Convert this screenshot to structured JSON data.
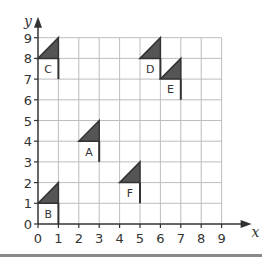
{
  "chart_data": {
    "type": "diagram",
    "title": "",
    "xlabel": "x",
    "ylabel": "y",
    "xlim": [
      0,
      9
    ],
    "ylim": [
      0,
      9
    ],
    "x_ticks": [
      "0",
      "1",
      "2",
      "3",
      "4",
      "5",
      "6",
      "7",
      "8",
      "9"
    ],
    "y_ticks": [
      "0",
      "1",
      "2",
      "3",
      "4",
      "5",
      "6",
      "7",
      "8",
      "9"
    ],
    "grid": true,
    "flags": [
      {
        "label": "A",
        "triangle": [
          [
            2,
            4
          ],
          [
            3,
            5
          ],
          [
            3,
            4
          ]
        ],
        "pole": [
          [
            3,
            4
          ],
          [
            3,
            3
          ]
        ]
      },
      {
        "label": "B",
        "triangle": [
          [
            0,
            1
          ],
          [
            1,
            2
          ],
          [
            1,
            1
          ]
        ],
        "pole": [
          [
            1,
            1
          ],
          [
            1,
            0
          ]
        ]
      },
      {
        "label": "C",
        "triangle": [
          [
            0,
            8
          ],
          [
            1,
            9
          ],
          [
            1,
            8
          ]
        ],
        "pole": [
          [
            1,
            8
          ],
          [
            1,
            7
          ]
        ]
      },
      {
        "label": "D",
        "triangle": [
          [
            5,
            8
          ],
          [
            6,
            9
          ],
          [
            6,
            8
          ]
        ],
        "pole": [
          [
            6,
            8
          ],
          [
            6,
            7
          ]
        ]
      },
      {
        "label": "E",
        "triangle": [
          [
            6,
            7
          ],
          [
            7,
            8
          ],
          [
            7,
            7
          ]
        ],
        "pole": [
          [
            7,
            7
          ],
          [
            7,
            6
          ]
        ]
      },
      {
        "label": "F",
        "triangle": [
          [
            4,
            2
          ],
          [
            5,
            3
          ],
          [
            5,
            2
          ]
        ],
        "pole": [
          [
            5,
            2
          ],
          [
            5,
            1
          ]
        ]
      }
    ]
  },
  "colors": {
    "grid": "#bdbdbd",
    "axis": "#333333",
    "flag_fill": "#555555",
    "rule": "#8a8a8a"
  }
}
